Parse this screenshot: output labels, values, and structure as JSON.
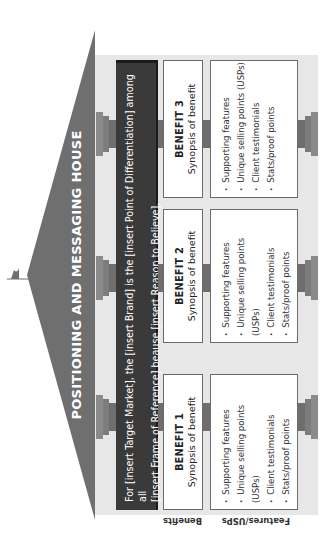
{
  "title": "POSITIONING AND MESSAGING HOUSE",
  "statement": {
    "line1": "For [insert Target Market], the [insert Brand] is the [insert Point of Differentiation] among all",
    "line2": "[insert Frame of Reference] beause [insert Reason to Believe]."
  },
  "row_labels": {
    "benefits": "Benefits",
    "features": "Features/USPs"
  },
  "benefits": [
    {
      "title": "BENEFIT 1",
      "subtitle": "Synopsis of benefit"
    },
    {
      "title": "BENEFIT 2",
      "subtitle": "Synopsis of benefit"
    },
    {
      "title": "BENEFIT 3",
      "subtitle": "Synopsis of benefit"
    }
  ],
  "features": [
    {
      "items": [
        "Supporting features",
        "Unique selling points (USPs)",
        "Client testimonials",
        "Stats/proof points"
      ]
    },
    {
      "items": [
        "Supporting features",
        "Unique selling points (USPs)",
        "Client testimonials",
        "Stats/proof points"
      ]
    },
    {
      "items": [
        "Supporting features",
        "Unique selling points (USPs)",
        "Client testimonials",
        "Stats/proof points"
      ]
    }
  ],
  "colors": {
    "roof": "#6f6f6f",
    "statement_bg": "#3a3a3a",
    "body_bg": "#e7e7e7",
    "pillar": "#8a8a8a",
    "box_border": "#6b6b6b"
  },
  "orientation": "rotated 90deg counter-clockwise"
}
